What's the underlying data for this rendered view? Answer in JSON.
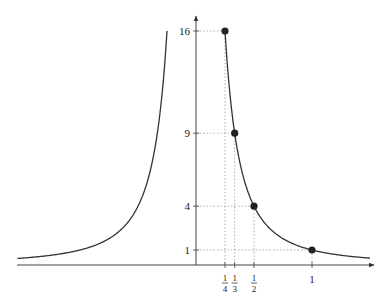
{
  "chart_data": {
    "type": "line",
    "title": "",
    "function": "y = 1/x^2",
    "xlabel": "",
    "ylabel": "",
    "grid": false,
    "legend": null,
    "xlim": [
      -1.54,
      1.5
    ],
    "ylim": [
      0,
      16.7
    ],
    "y_ticks": [
      {
        "value": 1,
        "label": "1"
      },
      {
        "value": 4,
        "label": "4"
      },
      {
        "value": 9,
        "label": "9"
      },
      {
        "value": 16,
        "label": "16"
      }
    ],
    "x_ticks": [
      {
        "value": 0.25,
        "num": "1",
        "den": "4"
      },
      {
        "value": 0.3333,
        "num": "1",
        "den": "3"
      },
      {
        "value": 0.5,
        "num": "1",
        "den": "2"
      },
      {
        "value": 1,
        "label": "1"
      }
    ],
    "points": [
      {
        "x": 0.25,
        "y": 16
      },
      {
        "x": 0.3333,
        "y": 9
      },
      {
        "x": 0.5,
        "y": 4
      },
      {
        "x": 1,
        "y": 1
      }
    ],
    "series": [
      {
        "name": "left branch",
        "x_range": [
          -1.54,
          -0.25
        ]
      },
      {
        "name": "right branch",
        "x_range": [
          0.25,
          1.5
        ]
      }
    ]
  }
}
